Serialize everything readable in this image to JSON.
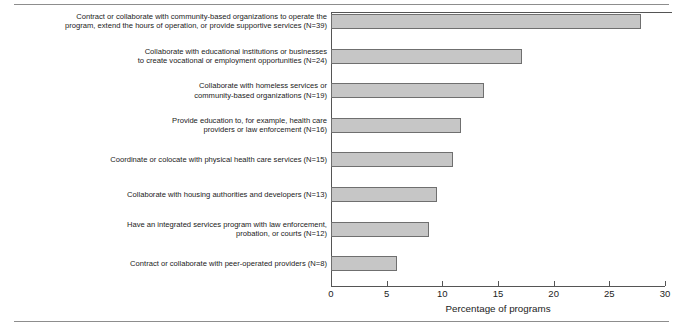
{
  "chart_data": {
    "type": "bar",
    "orientation": "horizontal",
    "title": "",
    "xlabel": "Percentage of programs",
    "ylabel": "",
    "xlim": [
      0,
      30
    ],
    "xticks": [
      0,
      5,
      10,
      15,
      20,
      25,
      30
    ],
    "xtick_labels": [
      "0",
      "5",
      "10",
      "15",
      "20",
      "25",
      "30"
    ],
    "grid": false,
    "legend": false,
    "bar_color": "#c6c6c6",
    "bar_edge_color": "#6f6f6f",
    "categories": [
      "Contract or collaborate with community-based organizations to operate the\nprogram, extend the hours of operation, or provide supportive services (N=39)",
      "Collaborate with educational institutions or businesses\nto create vocational or employment opportunities (N=24)",
      "Collaborate with homeless services or\ncommunity-based organizations (N=19)",
      "Provide education to, for example, health care\nproviders or law enforcement (N=16)",
      "Coordinate or colocate with physical health care services (N=15)",
      "Collaborate with housing authorities and developers (N=13)",
      "Have an integrated services program with law enforcement,\nprobation, or courts (N=12)",
      "Contract or collaborate with peer-operated providers (N=8)"
    ],
    "values": [
      27.8,
      17.2,
      13.7,
      11.7,
      11.0,
      9.5,
      8.8,
      5.9
    ],
    "counts": [
      39,
      24,
      19,
      16,
      15,
      13,
      12,
      8
    ]
  }
}
